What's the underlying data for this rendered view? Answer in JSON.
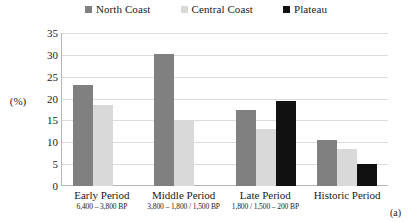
{
  "chart_data": {
    "type": "bar",
    "title": "",
    "xlabel": "",
    "ylabel": "(%)",
    "ylim": [
      0,
      35
    ],
    "yticks": [
      35,
      30,
      25,
      20,
      15,
      10,
      5,
      0
    ],
    "grid": true,
    "legend_position": "top-center",
    "categories": [
      "Early Period",
      "Middle Period",
      "Late Period",
      "Historic Period"
    ],
    "category_sublabels": [
      "6,400 – 3,800 BP",
      "3,800 – 1,800 / 1,500 BP",
      "1,800 / 1,500 – 200 BP",
      ""
    ],
    "series": [
      {
        "name": "North Coast",
        "color": "#808080",
        "values": [
          23.0,
          30.1,
          17.5,
          10.5
        ]
      },
      {
        "name": "Central Coast",
        "color": "#d9d9d9",
        "values": [
          18.5,
          15.1,
          13.0,
          8.5
        ]
      },
      {
        "name": "Plateau",
        "color": "#111111",
        "values": [
          null,
          null,
          19.5,
          5.0
        ]
      }
    ],
    "annotations": [
      "(a)"
    ]
  },
  "legend": {
    "items": [
      {
        "label": "North Coast",
        "swatch": "legend-swatch-north-coast"
      },
      {
        "label": "Central Coast",
        "swatch": "legend-swatch-central-coast"
      },
      {
        "label": "Plateau",
        "swatch": "legend-swatch-plateau"
      }
    ]
  },
  "axis": {
    "y_title": "(%)",
    "y_ticks": [
      "35",
      "30",
      "25",
      "20",
      "15",
      "10",
      "5",
      "0"
    ]
  },
  "caption": {
    "panel": "(a)"
  }
}
